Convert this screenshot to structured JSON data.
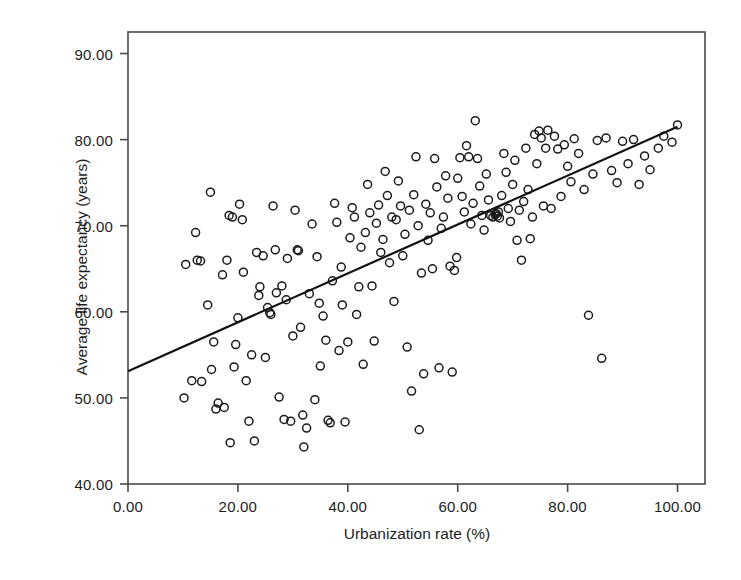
{
  "chart_data": {
    "type": "scatter",
    "title": "",
    "xlabel": "Urbanization rate (%)",
    "ylabel": "Average life expectancy (years)",
    "xlim": [
      0,
      105
    ],
    "ylim": [
      40,
      92.5
    ],
    "xticks": [
      0,
      20,
      40,
      60,
      80,
      100
    ],
    "xtick_labels": [
      "0.00",
      "20.00",
      "40.00",
      "60.00",
      "80.00",
      "100.00"
    ],
    "yticks": [
      40,
      50,
      60,
      70,
      80,
      90
    ],
    "ytick_labels": [
      "40.00",
      "50.00",
      "60.00",
      "70.00",
      "80.00",
      "90.00"
    ],
    "grid": false,
    "legend": null,
    "marker": {
      "shape": "circle-open",
      "edge_color": "#1a1a1a",
      "fill_color": "none",
      "size_px": 8
    },
    "fit_line": {
      "type": "linear-regression",
      "color": "#111111",
      "width_px": 2.2,
      "x_start": 0,
      "y_start": 53.1,
      "x_end": 100,
      "y_end": 81.5,
      "slope": 0.284,
      "intercept": 53.1
    },
    "n_points": 186,
    "points": [
      [
        10.2,
        50.0
      ],
      [
        10.5,
        65.5
      ],
      [
        11.6,
        52.0
      ],
      [
        12.3,
        69.2
      ],
      [
        12.6,
        66.0
      ],
      [
        13.2,
        65.9
      ],
      [
        13.4,
        51.9
      ],
      [
        14.5,
        60.8
      ],
      [
        15.0,
        73.9
      ],
      [
        15.2,
        53.3
      ],
      [
        15.6,
        56.5
      ],
      [
        16.0,
        48.7
      ],
      [
        16.4,
        49.4
      ],
      [
        17.2,
        64.3
      ],
      [
        17.5,
        48.9
      ],
      [
        18.0,
        66.0
      ],
      [
        18.4,
        71.2
      ],
      [
        18.6,
        44.8
      ],
      [
        19.0,
        71.0
      ],
      [
        19.3,
        53.6
      ],
      [
        19.6,
        56.2
      ],
      [
        20.0,
        59.3
      ],
      [
        20.3,
        72.5
      ],
      [
        20.8,
        70.7
      ],
      [
        21.0,
        64.6
      ],
      [
        21.5,
        52.0
      ],
      [
        22.0,
        47.3
      ],
      [
        22.5,
        55.0
      ],
      [
        23.0,
        45.0
      ],
      [
        23.4,
        66.9
      ],
      [
        23.8,
        61.9
      ],
      [
        24.0,
        62.9
      ],
      [
        24.6,
        66.5
      ],
      [
        25.0,
        54.7
      ],
      [
        25.4,
        60.5
      ],
      [
        25.8,
        59.9
      ],
      [
        26.0,
        59.7
      ],
      [
        26.4,
        72.3
      ],
      [
        26.8,
        67.2
      ],
      [
        27.0,
        62.2
      ],
      [
        27.5,
        50.1
      ],
      [
        28.0,
        63.0
      ],
      [
        28.4,
        47.5
      ],
      [
        28.8,
        61.4
      ],
      [
        29.0,
        66.2
      ],
      [
        29.6,
        47.3
      ],
      [
        30.0,
        57.2
      ],
      [
        30.4,
        71.8
      ],
      [
        30.8,
        67.2
      ],
      [
        31.0,
        67.1
      ],
      [
        31.4,
        58.2
      ],
      [
        31.8,
        48.0
      ],
      [
        32.0,
        44.3
      ],
      [
        32.5,
        46.5
      ],
      [
        33.0,
        62.1
      ],
      [
        33.5,
        70.2
      ],
      [
        34.0,
        49.8
      ],
      [
        34.4,
        66.4
      ],
      [
        34.8,
        61.0
      ],
      [
        35.0,
        53.7
      ],
      [
        35.5,
        59.5
      ],
      [
        36.0,
        56.7
      ],
      [
        36.4,
        47.4
      ],
      [
        36.8,
        47.1
      ],
      [
        37.2,
        63.6
      ],
      [
        37.6,
        72.6
      ],
      [
        38.0,
        70.4
      ],
      [
        38.4,
        55.5
      ],
      [
        38.8,
        65.2
      ],
      [
        39.0,
        60.8
      ],
      [
        39.5,
        47.2
      ],
      [
        40.0,
        56.5
      ],
      [
        40.4,
        68.6
      ],
      [
        40.8,
        72.1
      ],
      [
        41.2,
        71.0
      ],
      [
        41.6,
        59.7
      ],
      [
        42.0,
        62.9
      ],
      [
        42.4,
        67.5
      ],
      [
        42.8,
        53.9
      ],
      [
        43.2,
        69.2
      ],
      [
        43.6,
        74.8
      ],
      [
        44.0,
        71.5
      ],
      [
        44.4,
        63.0
      ],
      [
        44.8,
        56.6
      ],
      [
        45.2,
        70.3
      ],
      [
        45.6,
        72.4
      ],
      [
        46.0,
        66.9
      ],
      [
        46.4,
        68.4
      ],
      [
        46.8,
        76.3
      ],
      [
        47.2,
        73.5
      ],
      [
        47.6,
        65.7
      ],
      [
        48.0,
        71.0
      ],
      [
        48.4,
        61.2
      ],
      [
        48.8,
        70.7
      ],
      [
        49.2,
        75.2
      ],
      [
        49.6,
        72.3
      ],
      [
        50.0,
        66.5
      ],
      [
        50.4,
        69.0
      ],
      [
        50.8,
        55.9
      ],
      [
        51.2,
        71.8
      ],
      [
        51.6,
        50.8
      ],
      [
        52.0,
        73.6
      ],
      [
        52.4,
        78.0
      ],
      [
        52.8,
        70.0
      ],
      [
        53.0,
        46.3
      ],
      [
        53.4,
        64.5
      ],
      [
        53.8,
        52.8
      ],
      [
        54.2,
        72.5
      ],
      [
        54.6,
        68.3
      ],
      [
        55.0,
        71.5
      ],
      [
        55.4,
        65.0
      ],
      [
        55.8,
        77.8
      ],
      [
        56.2,
        74.5
      ],
      [
        56.6,
        53.5
      ],
      [
        57.0,
        69.7
      ],
      [
        57.4,
        71.0
      ],
      [
        57.8,
        75.8
      ],
      [
        58.2,
        73.2
      ],
      [
        58.6,
        65.3
      ],
      [
        59.0,
        53.0
      ],
      [
        59.4,
        64.8
      ],
      [
        59.8,
        66.3
      ],
      [
        60.0,
        75.5
      ],
      [
        60.4,
        77.9
      ],
      [
        60.8,
        73.4
      ],
      [
        61.2,
        71.6
      ],
      [
        61.6,
        79.3
      ],
      [
        62.0,
        78.0
      ],
      [
        62.4,
        70.2
      ],
      [
        62.8,
        72.6
      ],
      [
        63.2,
        82.2
      ],
      [
        63.6,
        77.8
      ],
      [
        64.0,
        74.6
      ],
      [
        64.4,
        71.2
      ],
      [
        64.8,
        69.5
      ],
      [
        65.2,
        76.0
      ],
      [
        65.6,
        73.0
      ],
      [
        66.0,
        71.2
      ],
      [
        66.4,
        71.0
      ],
      [
        66.8,
        71.3
      ],
      [
        67.0,
        71.4
      ],
      [
        67.2,
        71.1
      ],
      [
        67.4,
        71.6
      ],
      [
        67.6,
        70.9
      ],
      [
        68.0,
        73.5
      ],
      [
        68.4,
        78.4
      ],
      [
        68.8,
        76.2
      ],
      [
        69.2,
        72.0
      ],
      [
        69.6,
        70.5
      ],
      [
        70.0,
        74.8
      ],
      [
        70.4,
        77.6
      ],
      [
        70.8,
        68.3
      ],
      [
        71.2,
        71.8
      ],
      [
        71.6,
        66.0
      ],
      [
        72.0,
        72.8
      ],
      [
        72.4,
        79.0
      ],
      [
        72.8,
        74.2
      ],
      [
        73.2,
        68.5
      ],
      [
        73.6,
        71.0
      ],
      [
        74.0,
        80.6
      ],
      [
        74.4,
        77.2
      ],
      [
        74.8,
        81.0
      ],
      [
        75.2,
        80.2
      ],
      [
        75.6,
        72.3
      ],
      [
        76.0,
        79.0
      ],
      [
        76.4,
        81.1
      ],
      [
        77.0,
        72.0
      ],
      [
        77.6,
        80.4
      ],
      [
        78.2,
        78.9
      ],
      [
        78.8,
        73.4
      ],
      [
        79.4,
        79.4
      ],
      [
        80.0,
        76.9
      ],
      [
        80.6,
        75.1
      ],
      [
        81.2,
        80.1
      ],
      [
        82.0,
        78.4
      ],
      [
        83.0,
        74.2
      ],
      [
        83.8,
        59.6
      ],
      [
        84.6,
        76.0
      ],
      [
        85.4,
        79.9
      ],
      [
        86.2,
        54.6
      ],
      [
        87.0,
        80.2
      ],
      [
        88.0,
        76.4
      ],
      [
        89.0,
        75.0
      ],
      [
        90.0,
        79.8
      ],
      [
        91.0,
        77.2
      ],
      [
        92.0,
        80.0
      ],
      [
        93.0,
        74.8
      ],
      [
        94.0,
        78.1
      ],
      [
        95.0,
        76.5
      ],
      [
        96.5,
        79.0
      ],
      [
        97.5,
        80.4
      ],
      [
        99.0,
        79.7
      ],
      [
        100.0,
        81.7
      ]
    ]
  },
  "axes": {
    "frame_color": "#4a4a4a",
    "tick_color": "#4a4a4a"
  }
}
